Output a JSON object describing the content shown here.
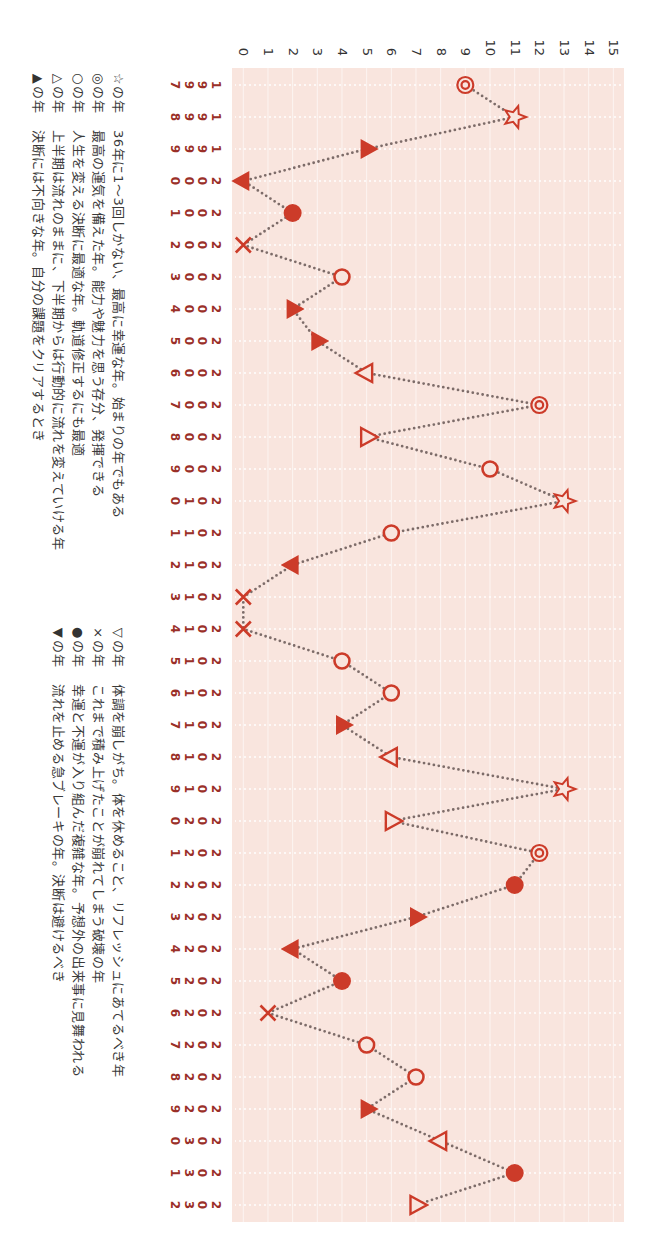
{
  "chart_data": {
    "type": "line",
    "title": "",
    "xlabel": "",
    "ylabel": "",
    "orientation": "rotated 90 degrees clockwise (years run top-to-bottom, values increase left-to-right)",
    "categories": [
      "1997",
      "1998",
      "1999",
      "2000",
      "2001",
      "2002",
      "2003",
      "2004",
      "2005",
      "2006",
      "2007",
      "2008",
      "2009",
      "2010",
      "2011",
      "2012",
      "2013",
      "2014",
      "2015",
      "2016",
      "2017",
      "2018",
      "2019",
      "2020",
      "2021",
      "2022",
      "2023",
      "2024",
      "2025",
      "2026",
      "2027",
      "2028",
      "2029",
      "2030",
      "2031",
      "2032"
    ],
    "x": [
      1997,
      1998,
      1999,
      2000,
      2001,
      2002,
      2003,
      2004,
      2005,
      2006,
      2007,
      2008,
      2009,
      2010,
      2011,
      2012,
      2013,
      2014,
      2015,
      2016,
      2017,
      2018,
      2019,
      2020,
      2021,
      2022,
      2023,
      2024,
      2025,
      2026,
      2027,
      2028,
      2029,
      2030,
      2031,
      2032
    ],
    "series": [
      {
        "name": "運気",
        "values": [
          9,
          11,
          5,
          0,
          2,
          0,
          4,
          2,
          3,
          5,
          12,
          5,
          10,
          13,
          6,
          2,
          0,
          0,
          4,
          6,
          4,
          6,
          13,
          6,
          12,
          11,
          7,
          2,
          4,
          1,
          5,
          7,
          5,
          8,
          11,
          7
        ],
        "markers": [
          "◎",
          "☆",
          "▲",
          "▼",
          "●",
          "×",
          "○",
          "▲",
          "▲",
          "▽",
          "◎",
          "△",
          "○",
          "☆",
          "○",
          "▼",
          "×",
          "×",
          "○",
          "○",
          "▲",
          "▽",
          "☆",
          "△",
          "◎",
          "●",
          "▲",
          "▼",
          "●",
          "×",
          "○",
          "○",
          "▲",
          "▽",
          "●",
          "△"
        ]
      }
    ],
    "yticks": [
      "0",
      "1",
      "2",
      "3",
      "4",
      "5",
      "6",
      "7",
      "8",
      "9",
      "10",
      "11",
      "12",
      "13",
      "14",
      "15"
    ],
    "ylim": [
      0,
      15
    ],
    "grid": true,
    "line_style": "dotted",
    "legend_position": "below plot (appears at left after rotation)"
  },
  "legend": {
    "left": [
      {
        "symbol": "☆",
        "suffix": "の年",
        "description": "36年に1～3回しかない、最高に幸運な年。始まりの年でもある"
      },
      {
        "symbol": "◎",
        "suffix": "の年",
        "description": "最高の運気を備えた年。能力や魅力を思う存分、発揮できる"
      },
      {
        "symbol": "○",
        "suffix": "の年",
        "description": "人生を変える決断に最適な年。軌道修正するにも最適"
      },
      {
        "symbol": "△",
        "suffix": "の年",
        "description": "上半期は流れのままに、下半期からは行動的に流れを変えていける年"
      },
      {
        "symbol": "▲",
        "suffix": "の年",
        "description": "決断には不向きな年。自分の課題をクリアするとき"
      }
    ],
    "right": [
      {
        "symbol": "▽",
        "suffix": "の年",
        "description": "体調を崩しがち。体を休めること、リフレッシュにあてるべき年"
      },
      {
        "symbol": "×",
        "suffix": "の年",
        "description": "これまで積み上げたことが崩れてしまう破壊の年"
      },
      {
        "symbol": "●",
        "suffix": "の年",
        "description": "幸運と不運が入り組んだ複雑な年。予想外の出来事に見舞われる"
      },
      {
        "symbol": "▼",
        "suffix": "の年",
        "description": "流れを止める急ブレーキの年。決断は避けるべき"
      }
    ]
  },
  "colors": {
    "marker": "#cc3b29",
    "line": "#7d6c69",
    "plot_background": "#f9e5de",
    "grid": "#ffffff",
    "year_label": "#9a2f28",
    "text": "#333333"
  }
}
